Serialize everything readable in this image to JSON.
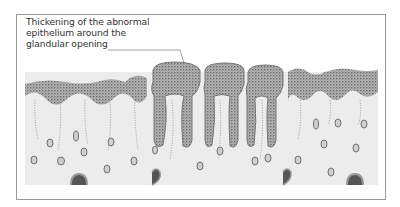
{
  "figure": {
    "annotation": {
      "lines": [
        "Thickening of the abnormal",
        "epithelium around the",
        "glandular opening"
      ]
    },
    "colors": {
      "frame": "#9a9a9a",
      "stroma": "#ebebeb",
      "epithelium": "#a8a8a8",
      "gland_wall": "#777777",
      "text": "#333333",
      "leader_line": "#888888"
    }
  }
}
